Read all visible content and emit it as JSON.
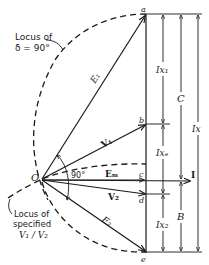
{
  "figure": {
    "type": "phasor-diagram",
    "annotations": {
      "locus_delta": [
        "Locus of",
        "δ = 90°"
      ],
      "locus_ratio": [
        "Locus of",
        "specified",
        "V₁ / V₂"
      ],
      "angle": "90°"
    },
    "points": {
      "origin": "O",
      "a": "a",
      "b": "b",
      "c": "c",
      "d": "d",
      "e": "e"
    },
    "vectors": {
      "E1": "E₁",
      "V1": "V₁",
      "Em": "Eₘ",
      "V2": "V₂",
      "E2": "E₂",
      "I": "I"
    },
    "dimensions": {
      "Ix1": "Ix₁",
      "Ixe": "Ixₑ",
      "Ix2": "Ix₂",
      "C": "C",
      "B": "B",
      "Ix": "Ix"
    }
  }
}
